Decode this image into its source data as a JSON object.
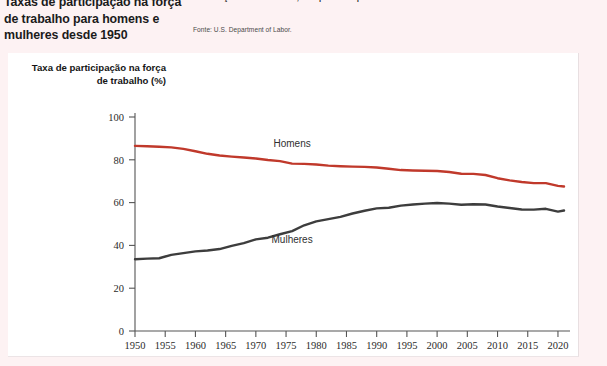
{
  "headline": "Taxas de participação na força de trabalho para homens e mulheres desde 1950",
  "body_copy": "na força de trabalho, ao passo que os homens a deixaram.",
  "source_note": "Fonte: U.S. Department of Labor.",
  "colors": {
    "men_line": "#c0392b",
    "women_line": "#3d3d3d",
    "axis": "#555555",
    "page_background": "#fdf2f3",
    "panel_background": "#ffffff"
  },
  "chart_data": {
    "type": "line",
    "title": "Taxas de participação na força de trabalho para homens e mulheres desde 1950",
    "xlabel": "",
    "ylabel": "Taxa de participação na força de trabalho (%)",
    "xlim": [
      1950,
      2021
    ],
    "ylim": [
      0,
      100
    ],
    "xticks": [
      1950,
      1955,
      1960,
      1965,
      1970,
      1975,
      1980,
      1985,
      1990,
      1995,
      2000,
      2005,
      2010,
      2015,
      2020
    ],
    "yticks": [
      0,
      20,
      40,
      60,
      80,
      100
    ],
    "grid": false,
    "legend_position": "inline-annotation",
    "x": [
      1950,
      1952,
      1954,
      1956,
      1958,
      1960,
      1962,
      1964,
      1966,
      1968,
      1970,
      1972,
      1974,
      1976,
      1978,
      1980,
      1982,
      1984,
      1986,
      1988,
      1990,
      1992,
      1994,
      1996,
      1998,
      2000,
      2002,
      2004,
      2006,
      2008,
      2010,
      2012,
      2014,
      2016,
      2018,
      2020,
      2021
    ],
    "series": [
      {
        "name": "Homens",
        "color": "#c0392b",
        "label_x": 1976,
        "label_y": 86,
        "values": [
          86.5,
          86.3,
          86.1,
          85.8,
          85.1,
          84.0,
          82.8,
          82.0,
          81.5,
          81.1,
          80.6,
          79.9,
          79.4,
          78.2,
          78.1,
          77.8,
          77.3,
          77.0,
          76.8,
          76.7,
          76.4,
          75.8,
          75.2,
          75.0,
          74.9,
          74.8,
          74.3,
          73.5,
          73.4,
          72.9,
          71.4,
          70.4,
          69.6,
          69.1,
          69.1,
          67.8,
          67.5
        ]
      },
      {
        "name": "Mulheres",
        "color": "#3d3d3d",
        "label_x": 1976,
        "label_y": 41,
        "values": [
          33.5,
          33.8,
          34.0,
          35.6,
          36.4,
          37.2,
          37.6,
          38.3,
          39.8,
          41.1,
          42.8,
          43.6,
          45.2,
          46.7,
          49.4,
          51.2,
          52.3,
          53.3,
          54.9,
          56.2,
          57.3,
          57.6,
          58.6,
          59.1,
          59.5,
          59.8,
          59.5,
          59.0,
          59.2,
          59.1,
          58.2,
          57.5,
          56.8,
          56.7,
          57.1,
          55.8,
          56.3
        ]
      }
    ]
  }
}
